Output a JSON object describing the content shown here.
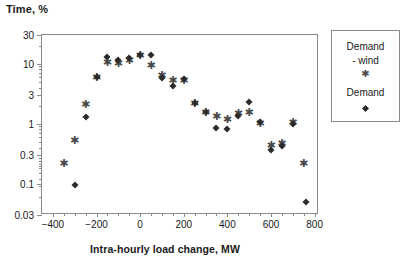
{
  "chart_data": {
    "type": "scatter",
    "title": "",
    "ylabel": "Time, %",
    "xlabel": "Intra-hourly load change, MW",
    "yscale": "log",
    "ylim": [
      0.03,
      30
    ],
    "xlim": [
      -450,
      820
    ],
    "grid": false,
    "legend_position": "right-outside",
    "ytick_labels": [
      "30",
      "10",
      "3",
      "1",
      "0.3",
      "0.1",
      "0.03"
    ],
    "ytick_values": [
      30,
      10,
      3,
      1,
      0.3,
      0.1,
      0.03
    ],
    "xtick_labels": [
      "-400",
      "-200",
      "0",
      "200",
      "400",
      "600",
      "800"
    ],
    "xtick_values": [
      -400,
      -200,
      0,
      200,
      400,
      600,
      800
    ],
    "series": [
      {
        "name": "Demand - wind",
        "marker": "star",
        "color": "#4a4a4a",
        "points": [
          {
            "x": -350,
            "y": 0.23
          },
          {
            "x": -300,
            "y": 0.55
          },
          {
            "x": -250,
            "y": 2.2
          },
          {
            "x": -200,
            "y": 6.3
          },
          {
            "x": -150,
            "y": 11.0
          },
          {
            "x": -100,
            "y": 10.5
          },
          {
            "x": -50,
            "y": 12.0
          },
          {
            "x": 0,
            "y": 14.5
          },
          {
            "x": 50,
            "y": 10.0
          },
          {
            "x": 100,
            "y": 6.6
          },
          {
            "x": 150,
            "y": 5.5
          },
          {
            "x": 200,
            "y": 5.6
          },
          {
            "x": 250,
            "y": 2.3
          },
          {
            "x": 300,
            "y": 1.65
          },
          {
            "x": 350,
            "y": 1.4
          },
          {
            "x": 400,
            "y": 1.25
          },
          {
            "x": 450,
            "y": 1.55
          },
          {
            "x": 500,
            "y": 1.6
          },
          {
            "x": 550,
            "y": 1.05
          },
          {
            "x": 600,
            "y": 0.45
          },
          {
            "x": 650,
            "y": 0.5
          },
          {
            "x": 700,
            "y": 1.1
          },
          {
            "x": 750,
            "y": 0.23
          }
        ]
      },
      {
        "name": "Demand",
        "marker": "diamond",
        "color": "#2b2b2b",
        "points": [
          {
            "x": -300,
            "y": 0.095
          },
          {
            "x": -250,
            "y": 1.3
          },
          {
            "x": -200,
            "y": 6.0
          },
          {
            "x": -150,
            "y": 13.0
          },
          {
            "x": -100,
            "y": 11.5
          },
          {
            "x": -50,
            "y": 12.5
          },
          {
            "x": 0,
            "y": 14.0
          },
          {
            "x": 50,
            "y": 14.0
          },
          {
            "x": 100,
            "y": 5.7
          },
          {
            "x": 150,
            "y": 4.3
          },
          {
            "x": 200,
            "y": 5.6
          },
          {
            "x": 250,
            "y": 2.2
          },
          {
            "x": 300,
            "y": 1.55
          },
          {
            "x": 350,
            "y": 0.85
          },
          {
            "x": 400,
            "y": 0.82
          },
          {
            "x": 450,
            "y": 1.35
          },
          {
            "x": 500,
            "y": 2.3
          },
          {
            "x": 550,
            "y": 1.05
          },
          {
            "x": 600,
            "y": 0.37
          },
          {
            "x": 650,
            "y": 0.42
          },
          {
            "x": 700,
            "y": 1.0
          },
          {
            "x": 760,
            "y": 0.05
          }
        ]
      }
    ]
  },
  "legend": {
    "entries": [
      {
        "label_line1": "Demand",
        "label_line2": "- wind",
        "marker": "star"
      },
      {
        "label_line1": "Demand",
        "label_line2": "",
        "marker": "diamond"
      }
    ]
  }
}
